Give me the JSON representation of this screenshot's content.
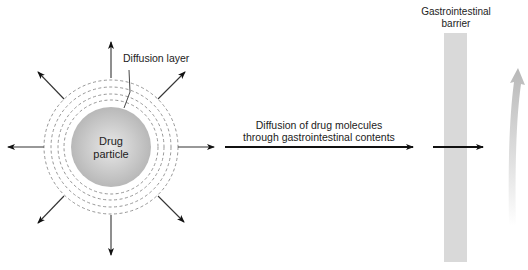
{
  "diagram": {
    "particle_label_line1": "Drug",
    "particle_label_line2": "particle",
    "diffusion_layer_label": "Diffusion layer",
    "transport_label_line1": "Diffusion of drug molecules",
    "transport_label_line2": "through gastrointestinal contents",
    "barrier_label_line1": "Gastrointestinal",
    "barrier_label_line2": "barrier",
    "colors": {
      "particle_center": "#e6e6e6",
      "particle_edge": "#b5b5b5",
      "barrier": "#d9d9d9",
      "arrow": "#111111",
      "dashed_ring": "#8a8a8a",
      "absorption_arrow": "#bdbdbd"
    }
  }
}
